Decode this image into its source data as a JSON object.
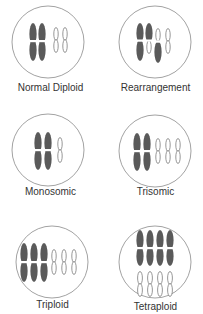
{
  "figure": {
    "colors": {
      "circle_stroke": "#8a8a8a",
      "large_chromosome_fill": "#5a5a5a",
      "small_chromosome_fill": "#ffffff",
      "small_chromosome_stroke": "#6a6a6a",
      "label_text": "#333333"
    },
    "panels": [
      {
        "id": "normal-diploid",
        "label": "Normal Diploid",
        "large_chromosomes": 2,
        "small_chromosomes": 2,
        "note": "two pairs of homologs"
      },
      {
        "id": "rearrangement",
        "label": "Rearrangement",
        "large_chromosomes": 2,
        "small_chromosomes": 2,
        "note": "segments exchanged between non-homologous chromosomes"
      },
      {
        "id": "monosomic",
        "label": "Monosomic",
        "large_chromosomes": 2,
        "small_chromosomes": 1,
        "note": "one copy of the small chromosome"
      },
      {
        "id": "trisomic",
        "label": "Trisomic",
        "large_chromosomes": 2,
        "small_chromosomes": 3,
        "note": "three copies of the small chromosome"
      },
      {
        "id": "triploid",
        "label": "Triploid",
        "large_chromosomes": 3,
        "small_chromosomes": 3,
        "note": "three sets"
      },
      {
        "id": "tetraploid",
        "label": "Tetraploid",
        "large_chromosomes": 4,
        "small_chromosomes": 4,
        "note": "four sets, small chromosomes drawn below large ones"
      }
    ]
  }
}
